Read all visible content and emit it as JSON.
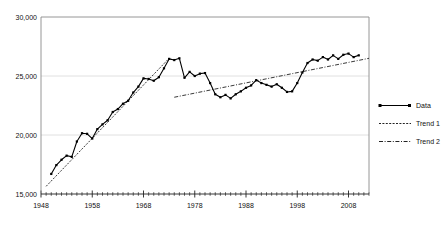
{
  "figure": {
    "clipped_title_fragment": "",
    "background": "#ffffff"
  },
  "legend": {
    "position": "right",
    "items": [
      {
        "label": "Data",
        "style": "solid-with-square-markers",
        "color": "#000000"
      },
      {
        "label": "Trend 1",
        "style": "dotted",
        "color": "#222222"
      },
      {
        "label": "Trend 2",
        "style": "dash-dot",
        "color": "#222222"
      }
    ]
  },
  "chart_data": {
    "type": "line",
    "title": "",
    "subtitle": "",
    "xlabel": "",
    "ylabel": "",
    "xlim": [
      1948,
      2012
    ],
    "ylim": [
      15000,
      30000
    ],
    "ytick_labels": [
      "30,000",
      "25,000",
      "20,000",
      "15,000"
    ],
    "ytick_values": [
      30000,
      25000,
      20000,
      15000
    ],
    "xtick_labels": [
      "1948",
      "1958",
      "1968",
      "1978",
      "1988",
      "1998",
      "2008"
    ],
    "xtick_values": [
      1948,
      1958,
      1968,
      1978,
      1988,
      1998,
      2008
    ],
    "minor_xticks_every": 1,
    "grid": "horizontal-only",
    "legend_position": "right",
    "series": [
      {
        "name": "Data",
        "style": "solid",
        "marker": "square",
        "color": "#000000",
        "x": [
          1950,
          1951,
          1952,
          1953,
          1954,
          1955,
          1956,
          1957,
          1958,
          1959,
          1960,
          1961,
          1962,
          1963,
          1964,
          1965,
          1966,
          1967,
          1968,
          1969,
          1970,
          1971,
          1972,
          1973,
          1974,
          1975,
          1976,
          1977,
          1978,
          1979,
          1980,
          1981,
          1982,
          1983,
          1984,
          1985,
          1986,
          1987,
          1988,
          1989,
          1990,
          1991,
          1992,
          1993,
          1994,
          1995,
          1996,
          1997,
          1998,
          1999,
          2000,
          2001,
          2002,
          2003,
          2004,
          2005,
          2006,
          2007,
          2008,
          2009,
          2010
        ],
        "values": [
          16700,
          17450,
          17900,
          18250,
          18150,
          19450,
          20150,
          20100,
          19700,
          20500,
          20900,
          21250,
          21950,
          22200,
          22650,
          22900,
          23600,
          24100,
          24800,
          24750,
          24600,
          24900,
          25650,
          26450,
          26350,
          26500,
          24850,
          25350,
          25000,
          25200,
          25250,
          24400,
          23450,
          23200,
          23400,
          23100,
          23450,
          23700,
          24000,
          24200,
          24650,
          24400,
          24250,
          24100,
          24300,
          24000,
          23650,
          23700,
          24400,
          25300,
          26100,
          26400,
          26300,
          26600,
          26400,
          26750,
          26450,
          26800,
          26900,
          26600,
          26750
        ]
      },
      {
        "name": "Trend 1",
        "style": "dotted",
        "color": "#222222",
        "x": [
          1949,
          1973
        ],
        "values": [
          15650,
          26500
        ]
      },
      {
        "name": "Trend 2",
        "style": "dash-dot",
        "color": "#222222",
        "x": [
          1974,
          2012
        ],
        "values": [
          23200,
          26500
        ]
      }
    ]
  }
}
